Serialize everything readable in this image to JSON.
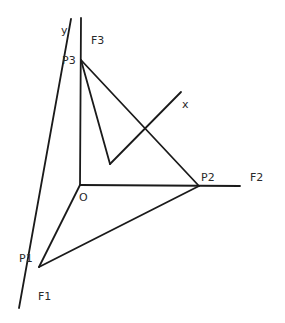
{
  "diagram": {
    "title": "",
    "points": {
      "O": {
        "label": "O",
        "x": 80,
        "y": 185
      },
      "P1": {
        "label": "P1",
        "x": 39,
        "y": 267
      },
      "P2": {
        "label": "P2",
        "x": 199,
        "y": 186
      },
      "P3": {
        "label": "P3",
        "x": 81,
        "y": 60
      }
    },
    "axes": {
      "x": {
        "label": "x"
      },
      "y": {
        "label": "y"
      }
    },
    "forces": {
      "F1": {
        "label": "F1"
      },
      "F2": {
        "label": "F2"
      },
      "F3": {
        "label": "F3"
      }
    },
    "labels": {
      "y": "y",
      "x": "x",
      "F3": "F3",
      "P3": "P3",
      "P2": "P2",
      "F2": "F2",
      "O": "O",
      "P1": "P1",
      "F1": "F1"
    }
  }
}
